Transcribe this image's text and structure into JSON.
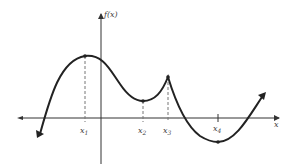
{
  "diagram": {
    "y_axis_label": "f(x)",
    "x_axis_label": "x",
    "points": [
      {
        "name": "x1",
        "sub": "1",
        "kind": "local maximum"
      },
      {
        "name": "x2",
        "sub": "2",
        "kind": "local minimum"
      },
      {
        "name": "x3",
        "sub": "3",
        "kind": "cusp / local maximum"
      },
      {
        "name": "x4",
        "sub": "4",
        "kind": "absolute minimum"
      }
    ],
    "colors": {
      "curve": "#222222",
      "axis": "#333333",
      "dashed": "#777777",
      "text": "#444444"
    }
  }
}
